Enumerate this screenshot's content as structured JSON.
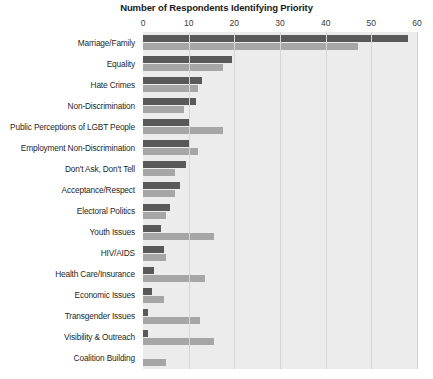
{
  "chart_data": {
    "type": "bar",
    "orientation": "horizontal",
    "title": "Number of Respondents Identifying Priority",
    "xlabel": "",
    "ylabel": "",
    "xlim": [
      0,
      60
    ],
    "xticks": [
      0,
      10,
      20,
      30,
      40,
      50,
      60
    ],
    "grid": true,
    "legend": "none",
    "colors": {
      "series_1": "#595959",
      "series_2": "#a6a6a6",
      "plot_background": "#ececec"
    },
    "categories": [
      "Marriage/Family",
      "Equality",
      "Hate Crimes",
      "Non-Discrimination",
      "Public Perceptions of LGBT People",
      "Employment Non-Discrimination",
      "Don't Ask, Don't Tell",
      "Acceptance/Respect",
      "Electoral Politics",
      "Youth Issues",
      "HIV/AIDS",
      "Health Care/Insurance",
      "Economic Issues",
      "Transgender Issues",
      "Visibility & Outreach",
      "Coalition Building"
    ],
    "series": [
      {
        "name": "Series 1",
        "color": "#595959",
        "values": [
          58,
          19.5,
          13,
          11.5,
          10,
          10,
          9.5,
          8,
          6,
          4,
          4.5,
          2.5,
          2,
          1,
          1,
          0
        ]
      },
      {
        "name": "Series 2",
        "color": "#a6a6a6",
        "values": [
          47,
          17.5,
          12,
          9,
          17.5,
          12,
          7,
          7,
          5,
          15.5,
          5,
          13.5,
          4.5,
          12.5,
          15.5,
          5
        ]
      }
    ]
  }
}
